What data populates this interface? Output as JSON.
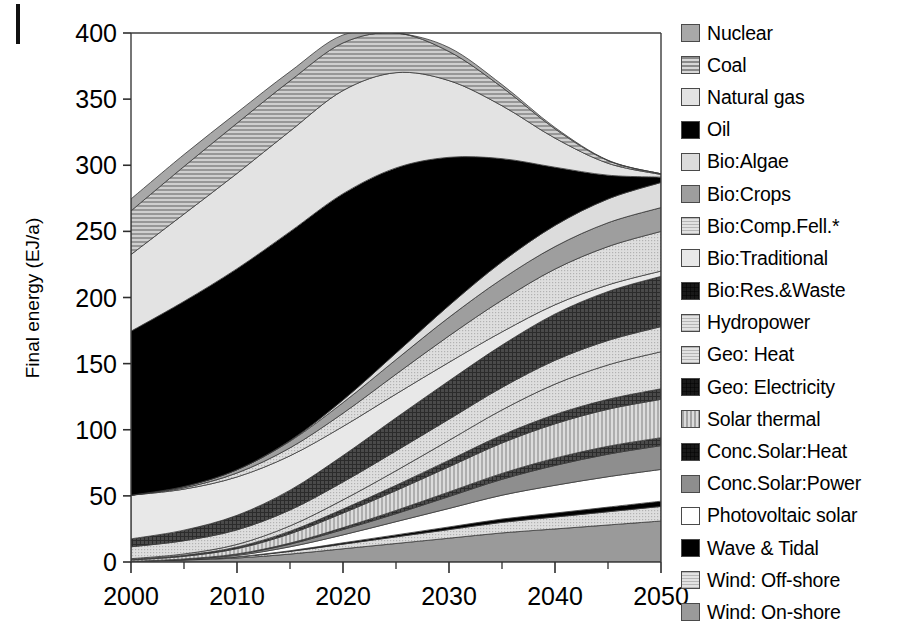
{
  "figure": {
    "ylabel": "Final energy (EJ/a)",
    "xlabel": "",
    "crop_mark": "crop-mark"
  },
  "chart_data": {
    "type": "area",
    "title": "",
    "xlabel": "",
    "ylabel": "Final energy (EJ/a)",
    "xlim": [
      2000,
      2050
    ],
    "ylim": [
      0,
      400
    ],
    "xticks": [
      2000,
      2010,
      2020,
      2030,
      2040,
      2050
    ],
    "xminorticks": [
      2005,
      2015,
      2025,
      2035,
      2045
    ],
    "yticks": [
      0,
      50,
      100,
      150,
      200,
      250,
      300,
      350,
      400
    ],
    "grid": false,
    "legend_position": "right",
    "stack_order_bottom_to_top": [
      "Wind: On-shore",
      "Wind: Off-shore",
      "Wave & Tidal",
      "Photovoltaic solar",
      "Conc.Solar:Power",
      "Conc.Solar:Heat",
      "Solar thermal",
      "Geo: Electricity",
      "Geo: Heat",
      "Hydropower",
      "Bio:Res.&Waste",
      "Bio:Traditional",
      "Bio:Comp.Fell.*",
      "Bio:Crops",
      "Bio:Algae",
      "Oil",
      "Natural gas",
      "Coal",
      "Nuclear"
    ],
    "x": [
      2000,
      2005,
      2010,
      2015,
      2020,
      2025,
      2030,
      2035,
      2040,
      2045,
      2050
    ],
    "series": [
      {
        "name": "Wind: On-shore",
        "color": "#9a9a9a",
        "pattern": "solid",
        "values": [
          0.5,
          1.5,
          3.0,
          6.0,
          10.0,
          14.0,
          18.0,
          22.0,
          25.0,
          28.0,
          31.0
        ]
      },
      {
        "name": "Wind: Off-shore",
        "color": "#d8d8d8",
        "pattern": "fine-dots",
        "values": [
          0.0,
          0.2,
          0.8,
          2.0,
          3.5,
          5.0,
          6.5,
          8.0,
          9.0,
          10.0,
          11.0
        ]
      },
      {
        "name": "Wave & Tidal",
        "color": "#000000",
        "pattern": "solid",
        "values": [
          0.0,
          0.1,
          0.2,
          0.5,
          1.0,
          1.5,
          2.0,
          2.5,
          3.0,
          3.5,
          4.0
        ]
      },
      {
        "name": "Photovoltaic solar",
        "color": "#ffffff",
        "pattern": "solid",
        "values": [
          0.0,
          0.2,
          1.0,
          3.0,
          6.0,
          10.0,
          14.0,
          18.0,
          21.0,
          23.0,
          24.0
        ]
      },
      {
        "name": "Conc.Solar:Power",
        "color": "#8e8e8e",
        "pattern": "solid",
        "values": [
          0.0,
          0.2,
          0.8,
          2.0,
          4.0,
          6.0,
          9.0,
          12.0,
          15.0,
          17.0,
          18.0
        ]
      },
      {
        "name": "Conc.Solar:Heat",
        "color": "#0d0d0d",
        "pattern": "cross",
        "values": [
          0.0,
          0.1,
          0.3,
          0.8,
          1.5,
          2.5,
          3.5,
          4.5,
          5.5,
          6.0,
          6.0
        ]
      },
      {
        "name": "Solar thermal",
        "color": "#c4c4c4",
        "pattern": "vstripe",
        "values": [
          1.0,
          2.0,
          4.0,
          7.0,
          11.0,
          15.0,
          19.0,
          23.0,
          26.0,
          28.0,
          29.0
        ]
      },
      {
        "name": "Geo: Electricity",
        "color": "#4e4e4e",
        "pattern": "cross",
        "values": [
          0.5,
          0.8,
          1.2,
          2.0,
          3.0,
          4.0,
          5.0,
          6.0,
          7.0,
          7.5,
          8.0
        ]
      },
      {
        "name": "Geo: Heat",
        "color": "#e0e0e0",
        "pattern": "fine-dots",
        "values": [
          0.5,
          1.0,
          2.0,
          4.0,
          7.0,
          11.0,
          15.0,
          19.0,
          23.0,
          26.0,
          28.0
        ]
      },
      {
        "name": "Hydropower",
        "color": "#cccccc",
        "pattern": "fine-dots",
        "values": [
          9.0,
          10.0,
          11.0,
          12.0,
          13.5,
          15.0,
          16.0,
          17.0,
          18.0,
          18.5,
          19.0
        ]
      },
      {
        "name": "Bio:Res.&Waste",
        "color": "#555555",
        "pattern": "cross",
        "values": [
          6.0,
          8.0,
          11.0,
          15.0,
          20.0,
          25.0,
          29.0,
          32.0,
          35.0,
          37.0,
          38.0
        ]
      },
      {
        "name": "Bio:Traditional",
        "color": "#e8e8e8",
        "pattern": "solid",
        "values": [
          33.0,
          31.0,
          29.0,
          26.0,
          22.0,
          18.0,
          14.0,
          10.0,
          7.0,
          5.0,
          4.0
        ]
      },
      {
        "name": "Bio:Comp.Fell.*",
        "color": "#d0d0d0",
        "pattern": "fine-dots",
        "values": [
          0.0,
          1.0,
          3.0,
          6.0,
          10.0,
          15.0,
          20.0,
          24.0,
          27.0,
          29.0,
          30.0
        ]
      },
      {
        "name": "Bio:Crops",
        "color": "#9e9e9e",
        "pattern": "solid",
        "values": [
          0.0,
          1.0,
          2.5,
          5.0,
          8.0,
          11.0,
          14.0,
          16.0,
          17.0,
          18.0,
          18.0
        ]
      },
      {
        "name": "Bio:Algae",
        "color": "#dcdcdc",
        "pattern": "solid",
        "values": [
          0.0,
          0.0,
          0.0,
          0.5,
          2.0,
          5.0,
          9.0,
          13.0,
          16.0,
          18.0,
          19.0
        ]
      },
      {
        "name": "Oil",
        "color": "#000000",
        "pattern": "solid",
        "values": [
          124.0,
          140.0,
          152.0,
          158.0,
          156.0,
          140.0,
          112.0,
          78.0,
          44.0,
          18.0,
          4.0
        ]
      },
      {
        "name": "Natural gas",
        "color": "#e3e3e3",
        "pattern": "solid",
        "values": [
          58.0,
          66.0,
          72.0,
          76.0,
          78.0,
          72.0,
          58.0,
          40.0,
          22.0,
          9.0,
          2.0
        ]
      },
      {
        "name": "Coal",
        "color": "#b0b0b0",
        "pattern": "hstripe",
        "values": [
          33.0,
          36.0,
          38.0,
          38.0,
          36.0,
          30.0,
          22.0,
          14.0,
          7.0,
          2.0,
          0.5
        ]
      },
      {
        "name": "Nuclear",
        "color": "#a8a8a8",
        "pattern": "solid",
        "values": [
          9.0,
          9.0,
          8.0,
          7.0,
          6.0,
          4.5,
          3.0,
          2.0,
          1.0,
          0.3,
          0.0
        ]
      }
    ],
    "totals": [
      274.5,
      308.1,
      340.8,
      370.8,
      388.5,
      404.5,
      388.0,
      360.0,
      328.5,
      303.8,
      293.5
    ],
    "note": "Stacked area of final energy by source, 2000-2050"
  },
  "legend": {
    "items": [
      {
        "label": "Nuclear",
        "pattern": "solid",
        "color": "#a8a8a8"
      },
      {
        "label": "Coal",
        "pattern": "hstripe",
        "color": "#b0b0b0"
      },
      {
        "label": "Natural gas",
        "pattern": "solid",
        "color": "#e3e3e3"
      },
      {
        "label": "Oil",
        "pattern": "solid",
        "color": "#000000"
      },
      {
        "label": "Bio:Algae",
        "pattern": "solid",
        "color": "#dcdcdc"
      },
      {
        "label": "Bio:Crops",
        "pattern": "solid",
        "color": "#9e9e9e"
      },
      {
        "label": "Bio:Comp.Fell.*",
        "pattern": "fine-dots",
        "color": "#d0d0d0"
      },
      {
        "label": "Bio:Traditional",
        "pattern": "solid",
        "color": "#e8e8e8"
      },
      {
        "label": "Bio:Res.&Waste",
        "pattern": "cross",
        "color": "#555555"
      },
      {
        "label": "Hydropower",
        "pattern": "fine-dots",
        "color": "#cccccc"
      },
      {
        "label": "Geo: Heat",
        "pattern": "fine-dots",
        "color": "#e0e0e0"
      },
      {
        "label": "Geo: Electricity",
        "pattern": "cross",
        "color": "#4e4e4e"
      },
      {
        "label": "Solar thermal",
        "pattern": "vstripe",
        "color": "#c4c4c4"
      },
      {
        "label": "Conc.Solar:Heat",
        "pattern": "cross",
        "color": "#0d0d0d"
      },
      {
        "label": "Conc.Solar:Power",
        "pattern": "solid",
        "color": "#8e8e8e"
      },
      {
        "label": "Photovoltaic solar",
        "pattern": "solid",
        "color": "#ffffff"
      },
      {
        "label": "Wave & Tidal",
        "pattern": "solid",
        "color": "#000000"
      },
      {
        "label": "Wind: Off-shore",
        "pattern": "fine-dots",
        "color": "#d8d8d8"
      },
      {
        "label": "Wind: On-shore",
        "pattern": "solid",
        "color": "#9a9a9a"
      }
    ]
  }
}
